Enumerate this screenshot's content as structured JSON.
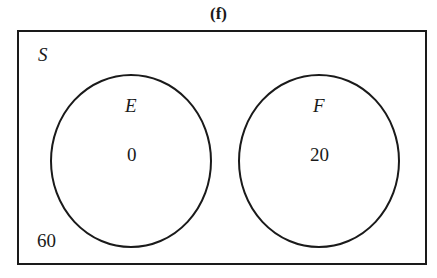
{
  "figure": {
    "title": "(f)",
    "universe_label": "S",
    "outside_value": "60",
    "sets": [
      {
        "label": "E",
        "value": "0"
      },
      {
        "label": "F",
        "value": "20"
      }
    ],
    "colors": {
      "stroke": "#1a1a1a",
      "background": "#ffffff"
    }
  }
}
